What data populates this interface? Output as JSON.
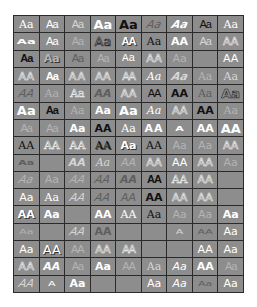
{
  "gallery": {
    "title": "WordArt Gallery",
    "columns": 9,
    "rows": 16,
    "colors": {
      "cell_bg": "#8d8d8d",
      "border": "#2a2a2a",
      "empty_bg": "#ffffff"
    },
    "cells": [
      {
        "label": "Aa",
        "style": "s-white s-serif"
      },
      {
        "label": "Aa",
        "style": "s-white s-serif s-narrow"
      },
      {
        "label": "Aa",
        "style": "s-light s-serif s-narrow"
      },
      {
        "label": "Aa",
        "style": "s-white s-bold s-big"
      },
      {
        "label": "Aa",
        "style": "s-dark s-bold s-big"
      },
      {
        "label": "Aa",
        "style": "s-gray s-ital s-skew"
      },
      {
        "label": "Aa",
        "style": "s-white s-ital s-bold s-skew"
      },
      {
        "label": "Aa",
        "style": "s-dark s-serif s-narrow"
      },
      {
        "label": "Aa",
        "style": "s-white s-serif"
      },
      {
        "label": "Aa",
        "style": "s-white s-bold s-big s-wave"
      },
      {
        "label": "Aa",
        "style": "s-white s-serif s-narrow"
      },
      {
        "label": "Aa",
        "style": "s-pale s-narrow"
      },
      {
        "label": "Aa",
        "style": "s-dark s-big s-outdark"
      },
      {
        "label": "AA",
        "style": "s-white s-bold s-narrow s-shadow"
      },
      {
        "label": "Aa",
        "style": "s-dark s-serif"
      },
      {
        "label": "AA",
        "style": "s-white s-bold"
      },
      {
        "label": "Aa",
        "style": "s-light s-serif s-narrow"
      },
      {
        "label": "AA",
        "style": "s-light s-outline"
      },
      {
        "label": "Aa",
        "style": "s-dark s-bold s-narrow"
      },
      {
        "label": "Aa",
        "style": "s-pale s-bold s-shadow"
      },
      {
        "label": "Aa",
        "style": "s-gray s-narrow"
      },
      {
        "label": "Aa",
        "style": "s-pale s-narrow"
      },
      {
        "label": "Aa",
        "style": "s-white s-mono"
      },
      {
        "label": "AA",
        "style": "s-pale s-outline"
      },
      {
        "label": "Aa",
        "style": "s-pale"
      },
      {
        "label": "",
        "style": ""
      },
      {
        "label": "AA",
        "style": "s-white"
      },
      {
        "label": "AA",
        "style": "s-light s-outline"
      },
      {
        "label": "Aa",
        "style": "s-white s-bold s-narrow"
      },
      {
        "label": "AA",
        "style": "s-light s-outline s-wide"
      },
      {
        "label": "AA",
        "style": "s-white s-outline"
      },
      {
        "label": "AA",
        "style": "s-pale s-narrow s-outline"
      },
      {
        "label": "Aa",
        "style": "s-white s-ital s-serif"
      },
      {
        "label": "Aa",
        "style": "s-light s-ital s-bold s-skew"
      },
      {
        "label": "Aa",
        "style": "s-pale s-serif"
      },
      {
        "label": "Aa",
        "style": "s-light s-serif"
      },
      {
        "label": "AA",
        "style": "s-gray s-ital s-skew"
      },
      {
        "label": "Aa",
        "style": "s-pale s-serif"
      },
      {
        "label": "Aa",
        "style": "s-pale s-serif s-outline"
      },
      {
        "label": "AA",
        "style": "s-gray s-ital s-bold"
      },
      {
        "label": "AA",
        "style": "s-white s-outline"
      },
      {
        "label": "AA",
        "style": "s-dark s-serif s-narrow"
      },
      {
        "label": "AA",
        "style": "s-dark s-bold"
      },
      {
        "label": "Aa",
        "style": "s-gray s-serif"
      },
      {
        "label": "Aa",
        "style": "s-white s-bold s-big s-outdark"
      },
      {
        "label": "Aa",
        "style": "s-white s-bold s-big"
      },
      {
        "label": "Aa",
        "style": "s-dark s-serif s-bold s-narrow"
      },
      {
        "label": "Aa",
        "style": "s-pale s-serif"
      },
      {
        "label": "Aa",
        "style": "s-white s-bold"
      },
      {
        "label": "Aa",
        "style": "s-white s-bold s-big"
      },
      {
        "label": "Aa",
        "style": "s-white s-ital s-serif"
      },
      {
        "label": "AA",
        "style": "s-pale s-outline"
      },
      {
        "label": "AA",
        "style": "s-dark s-bold"
      },
      {
        "label": "Aa",
        "style": "s-pale s-serif"
      },
      {
        "label": "Aa",
        "style": "s-pale s-serif s-narrow"
      },
      {
        "label": "Aa",
        "style": "s-pale s-serif s-narrow"
      },
      {
        "label": "Aa",
        "style": "s-white s-bold"
      },
      {
        "label": "AA",
        "style": "s-dark s-bold"
      },
      {
        "label": "Aa",
        "style": "s-white s-serif"
      },
      {
        "label": "AA",
        "style": "s-white s-bold s-wide"
      },
      {
        "label": "A",
        "style": "s-white s-bold s-wave"
      },
      {
        "label": "AA",
        "style": "s-white s-bold"
      },
      {
        "label": "AA",
        "style": "s-white s-bold s-big"
      },
      {
        "label": "AA",
        "style": "s-dark s-serif"
      },
      {
        "label": "AA",
        "style": "s-light s-serif s-outline"
      },
      {
        "label": "AA",
        "style": "s-light s-serif s-outline"
      },
      {
        "label": "AA",
        "style": "s-dark s-serif s-shadow"
      },
      {
        "label": "Aa",
        "style": "s-white s-bold s-shadow"
      },
      {
        "label": "AA",
        "style": "s-dark s-serif"
      },
      {
        "label": "Aa",
        "style": "s-pale"
      },
      {
        "label": "Aa",
        "style": "s-pale"
      },
      {
        "label": "AA",
        "style": "s-light s-outline"
      },
      {
        "label": "Aa",
        "style": "s-gray s-bold s-wave"
      },
      {
        "label": "",
        "style": ""
      },
      {
        "label": "AA",
        "style": "s-light s-ital s-bold"
      },
      {
        "label": "Aa",
        "style": "s-light s-ital s-serif"
      },
      {
        "label": "AA",
        "style": "s-pale s-ital"
      },
      {
        "label": "AA",
        "style": "s-light s-outline"
      },
      {
        "label": "AA",
        "style": "s-white"
      },
      {
        "label": "AA",
        "style": "s-light s-outline"
      },
      {
        "label": "Aa",
        "style": "s-pale"
      },
      {
        "label": "Aa",
        "style": "s-pale s-ital s-skew"
      },
      {
        "label": "Aa",
        "style": "s-pale"
      },
      {
        "label": "AA",
        "style": "s-pale s-ital s-skew"
      },
      {
        "label": "AA",
        "style": "s-gray s-ital s-skew"
      },
      {
        "label": "AA",
        "style": "s-gray s-ital s-bold"
      },
      {
        "label": "AA",
        "style": "s-dark s-bold s-narrow"
      },
      {
        "label": "AA",
        "style": "s-light s-serif s-outline"
      },
      {
        "label": "AA",
        "style": "s-light s-outline"
      },
      {
        "label": "",
        "style": ""
      },
      {
        "label": "Aa",
        "style": "s-white"
      },
      {
        "label": "Aa",
        "style": "s-white s-serif"
      },
      {
        "label": "AA",
        "style": "s-light s-ital s-skew"
      },
      {
        "label": "AA",
        "style": "s-gray s-ital s-skew"
      },
      {
        "label": "AA",
        "style": "s-gray s-ital"
      },
      {
        "label": "AA",
        "style": "s-dark s-bold"
      },
      {
        "label": "AA",
        "style": "s-light s-outline"
      },
      {
        "label": "AA",
        "style": "s-light s-outline"
      },
      {
        "label": "",
        "style": ""
      },
      {
        "label": "AA",
        "style": "s-white s-bold s-shadow"
      },
      {
        "label": "Aa",
        "style": "s-white s-bold"
      },
      {
        "label": "",
        "style": ""
      },
      {
        "label": "AA",
        "style": "s-white s-bold"
      },
      {
        "label": "AA",
        "style": "s-white s-serif"
      },
      {
        "label": "Aa",
        "style": "s-dark s-serif"
      },
      {
        "label": "Aa",
        "style": "s-pale"
      },
      {
        "label": "Aa",
        "style": "s-pale"
      },
      {
        "label": "Aa",
        "style": "s-white s-bold"
      },
      {
        "label": "Aa",
        "style": "s-pale s-wave"
      },
      {
        "label": "",
        "style": ""
      },
      {
        "label": "AA",
        "style": "s-light s-ital s-skew"
      },
      {
        "label": "AA",
        "style": "s-gray s-bold"
      },
      {
        "label": "",
        "style": ""
      },
      {
        "label": "",
        "style": ""
      },
      {
        "label": "A",
        "style": "s-light s-wave"
      },
      {
        "label": "AA",
        "style": "s-gray s-wave"
      },
      {
        "label": "Aa",
        "style": "s-white"
      },
      {
        "label": "Aa",
        "style": "s-white"
      },
      {
        "label": "AA",
        "style": "s-white s-big s-shadow"
      },
      {
        "label": "AA",
        "style": "s-pale s-narrow"
      },
      {
        "label": "AA",
        "style": "s-pale s-outline"
      },
      {
        "label": "AA",
        "style": "s-pale s-outline s-narrow"
      },
      {
        "label": "",
        "style": ""
      },
      {
        "label": "",
        "style": ""
      },
      {
        "label": "AA",
        "style": "s-white"
      },
      {
        "label": "Aa",
        "style": "s-white"
      },
      {
        "label": "AA",
        "style": "s-light s-outline"
      },
      {
        "label": "AA",
        "style": "s-white s-bold s-ital"
      },
      {
        "label": "Aa",
        "style": "s-pale s-narrow"
      },
      {
        "label": "Aa",
        "style": "s-white s-bold"
      },
      {
        "label": "AA",
        "style": "s-pale s-narrow"
      },
      {
        "label": "Aa",
        "style": "s-light s-serif"
      },
      {
        "label": "Aa",
        "style": "s-white s-ital"
      },
      {
        "label": "AA",
        "style": "s-white s-bold"
      },
      {
        "label": "Aa",
        "style": "s-pale s-narrow"
      },
      {
        "label": "AA",
        "style": "s-light s-ital s-skew"
      },
      {
        "label": "A",
        "style": "s-white s-wave"
      },
      {
        "label": "Aa",
        "style": "s-white s-bold"
      },
      {
        "label": "",
        "style": ""
      },
      {
        "label": "",
        "style": ""
      },
      {
        "label": "Aa",
        "style": "s-white"
      },
      {
        "label": "Aa",
        "style": "s-white s-ital"
      },
      {
        "label": "Aa",
        "style": "s-gray s-wave"
      },
      {
        "label": "Aa",
        "style": "s-white"
      },
      {
        "label": "Aa",
        "style": "s-pale s-narrow"
      },
      {
        "label": "AA",
        "style": "s-pale s-serif s-narrow"
      },
      {
        "label": "AA",
        "style": "s-white s-bold"
      },
      {
        "label": "AA",
        "style": "s-pale s-outline"
      }
    ]
  }
}
